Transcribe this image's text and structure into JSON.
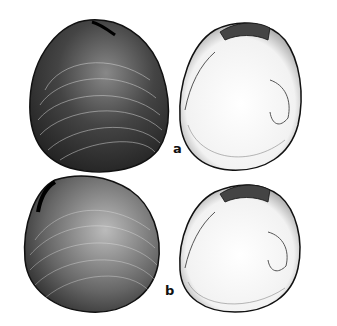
{
  "figure": {
    "labels": [
      "a",
      "b"
    ],
    "rows": [
      {
        "label": "a",
        "views": [
          "exterior",
          "interior"
        ]
      },
      {
        "label": "b",
        "views": [
          "exterior",
          "interior"
        ]
      }
    ]
  }
}
